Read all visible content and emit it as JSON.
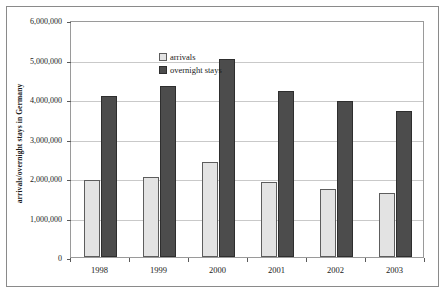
{
  "chart_data": {
    "type": "bar",
    "title": "",
    "subtitle": "",
    "xlabel": "",
    "ylabel": "arrivals/overnight stays in Germany",
    "categories": [
      "1998",
      "1999",
      "2000",
      "2001",
      "2002",
      "2003"
    ],
    "series": [
      {
        "name": "arrivals",
        "color": "#e3e3e3",
        "values": [
          1950000,
          2020000,
          2400000,
          1900000,
          1730000,
          1630000
        ]
      },
      {
        "name": "overnight stays",
        "color": "#4c4c4c",
        "values": [
          4080000,
          4320000,
          5020000,
          4200000,
          3940000,
          3700000
        ]
      }
    ],
    "ylim": [
      0,
      6000000
    ],
    "ytick_values": [
      0,
      1000000,
      2000000,
      3000000,
      4000000,
      5000000,
      6000000
    ],
    "ytick_labels": [
      "0",
      "1,000,000",
      "2,000,000",
      "3,000,000",
      "4,000,000",
      "5,000,000",
      "6,000,000"
    ],
    "grid": true,
    "legend_position": "top-left-inside",
    "legend_entries": [
      "arrivals",
      "overnight stays"
    ]
  },
  "colors": {
    "arrivals": "#e3e3e3",
    "overnight": "#4c4c4c",
    "gridline": "#c9c9c9",
    "frame": "#9a9a9a",
    "text": "#1a1a1a"
  }
}
